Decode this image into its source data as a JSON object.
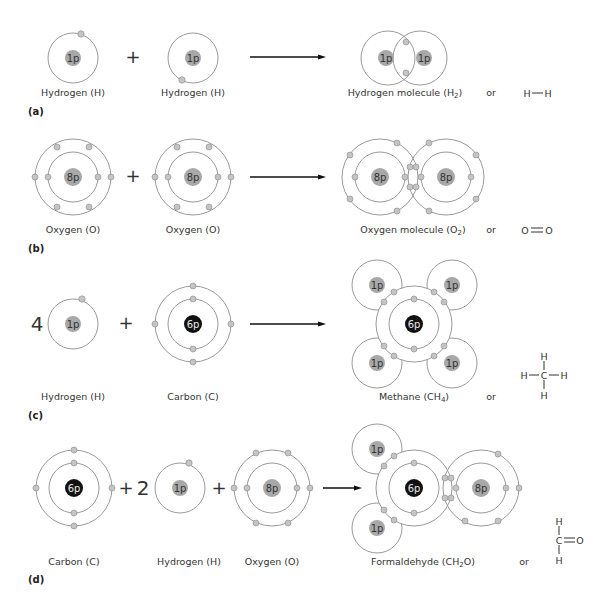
{
  "figure": {
    "panels": [
      {
        "id": "a",
        "label": "(a)",
        "reactants": [
          {
            "label": "Hydrogen (H)",
            "nucleus": "1p"
          },
          {
            "label": "Hydrogen (H)",
            "nucleus": "1p"
          }
        ],
        "operators": [
          "+"
        ],
        "product": {
          "label_main": "Hydrogen molecule (H",
          "label_sub": "2",
          "label_end": ")",
          "nuclei": [
            "1p",
            "1p"
          ]
        },
        "or": "or",
        "structural_formula": {
          "left": "H",
          "bond": "—",
          "right": "H"
        }
      },
      {
        "id": "b",
        "label": "(b)",
        "reactants": [
          {
            "label": "Oxygen (O)",
            "nucleus": "8p"
          },
          {
            "label": "Oxygen (O)",
            "nucleus": "8p"
          }
        ],
        "operators": [
          "+"
        ],
        "product": {
          "label_main": "Oxygen molecule (O",
          "label_sub": "2",
          "label_end": ")",
          "nuclei": [
            "8p",
            "8p"
          ]
        },
        "or": "or",
        "structural_formula": {
          "left": "O",
          "bond": "=",
          "right": "O"
        }
      },
      {
        "id": "c",
        "label": "(c)",
        "coefficient": "4",
        "reactants": [
          {
            "label": "Hydrogen (H)",
            "nucleus": "1p"
          },
          {
            "label": "Carbon (C)",
            "nucleus": "6p"
          }
        ],
        "operators": [
          "+"
        ],
        "product": {
          "label_main": "Methane (CH",
          "label_sub": "4",
          "label_end": ")",
          "nuclei": [
            "6p",
            "1p",
            "1p",
            "1p",
            "1p"
          ]
        },
        "or": "or",
        "structural_formula": {
          "center": "C",
          "top": "H",
          "bottom": "H",
          "left": "H",
          "right": "H"
        }
      },
      {
        "id": "d",
        "label": "(d)",
        "coefficient": "2",
        "reactants": [
          {
            "label": "Carbon (C)",
            "nucleus": "6p"
          },
          {
            "label": "Hydrogen (H)",
            "nucleus": "1p"
          },
          {
            "label": "Oxygen (O)",
            "nucleus": "8p"
          }
        ],
        "operators": [
          "+",
          "+"
        ],
        "product": {
          "label_main": "Formaldehyde (CH",
          "label_sub": "2",
          "label_end": "O)",
          "nuclei": [
            "6p",
            "8p",
            "1p",
            "1p"
          ]
        },
        "or": "or",
        "structural_formula": {
          "center": "C",
          "top": "H",
          "bottom": "H",
          "right": "O"
        }
      }
    ],
    "colors": {
      "orbit": "#9a9a9a",
      "nucleus_gray": "#a8a8a8",
      "nucleus_carbon": "#111111",
      "electron": "#c4c4c4",
      "arrow": "#111111"
    }
  }
}
